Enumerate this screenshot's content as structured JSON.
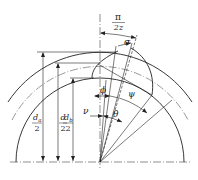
{
  "diagram": {
    "labels": {
      "pi": "π",
      "two_z": "2z",
      "sigma": "σ",
      "phi": "ϕ",
      "psi": "ψ",
      "nu": "ν",
      "theta": "θ",
      "d": "d",
      "a": "a",
      "b": "b",
      "two": "2"
    },
    "dimensions": [
      {
        "name": "addendum-radius",
        "numerator": "d",
        "subscript": "a",
        "denominator": "2"
      },
      {
        "name": "pitch-radius",
        "numerator": "d",
        "subscript": "",
        "denominator": "2"
      },
      {
        "name": "base-radius",
        "numerator": "d",
        "subscript": "b",
        "denominator": "2"
      }
    ],
    "angles": [
      "π/2z",
      "σ",
      "ϕ",
      "ψ",
      "ν",
      "θ"
    ],
    "colors": {
      "stroke": "#222222",
      "background": "#ffffff"
    }
  }
}
